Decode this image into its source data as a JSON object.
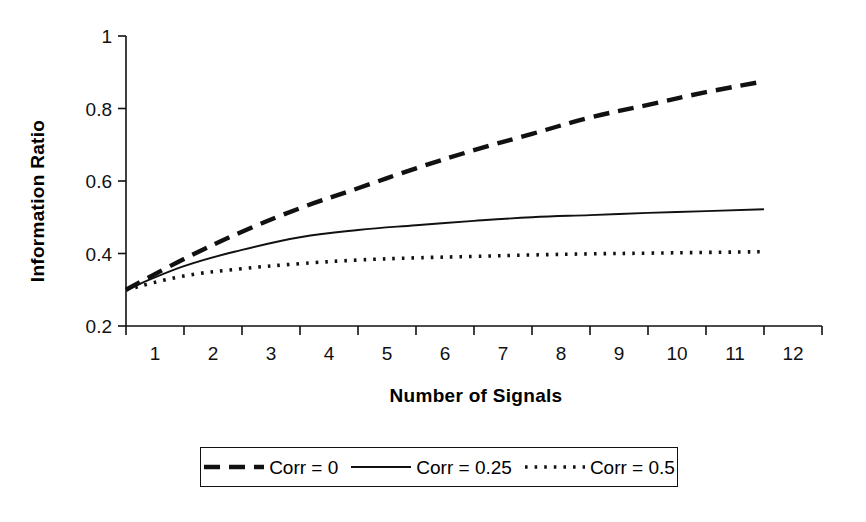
{
  "chart_data": {
    "type": "line",
    "title": "",
    "xlabel": "Number of Signals",
    "ylabel": "Information Ratio",
    "x": [
      1,
      2,
      3,
      4,
      5,
      6,
      7,
      8,
      9,
      10,
      11,
      12
    ],
    "xtick_labels": [
      "1",
      "2",
      "3",
      "4",
      "5",
      "6",
      "7",
      "8",
      "9",
      "10",
      "11",
      "12"
    ],
    "ytick_labels": [
      "1",
      "0.8",
      "0.6",
      "0.4",
      "0.2"
    ],
    "ytick_values": [
      1,
      0.8,
      0.6,
      0.4,
      0.2
    ],
    "ylim": [
      0.2,
      1.0
    ],
    "xlim": [
      1,
      12
    ],
    "grid": false,
    "legend_position": "bottom",
    "series": [
      {
        "name": "Corr = 0",
        "style": "dashed",
        "color": "#111111",
        "values": [
          0.3,
          0.385,
          0.46,
          0.525,
          0.58,
          0.635,
          0.685,
          0.73,
          0.775,
          0.81,
          0.845,
          0.875
        ]
      },
      {
        "name": "Corr = 0.25",
        "style": "solid",
        "color": "#111111",
        "values": [
          0.3,
          0.365,
          0.41,
          0.445,
          0.465,
          0.478,
          0.49,
          0.5,
          0.506,
          0.512,
          0.517,
          0.522
        ]
      },
      {
        "name": "Corr = 0.5",
        "style": "dotted",
        "color": "#111111",
        "values": [
          0.3,
          0.338,
          0.358,
          0.372,
          0.382,
          0.388,
          0.392,
          0.396,
          0.399,
          0.401,
          0.403,
          0.405
        ]
      }
    ]
  },
  "legend": {
    "entries": [
      {
        "label": "Corr = 0",
        "style": "dashed"
      },
      {
        "label": "Corr = 0.25",
        "style": "solid"
      },
      {
        "label": "Corr = 0.5",
        "style": "dotted"
      }
    ]
  },
  "axes": {
    "y_title": "Information Ratio",
    "x_title": "Number of Signals",
    "axis_color": "#111111"
  }
}
